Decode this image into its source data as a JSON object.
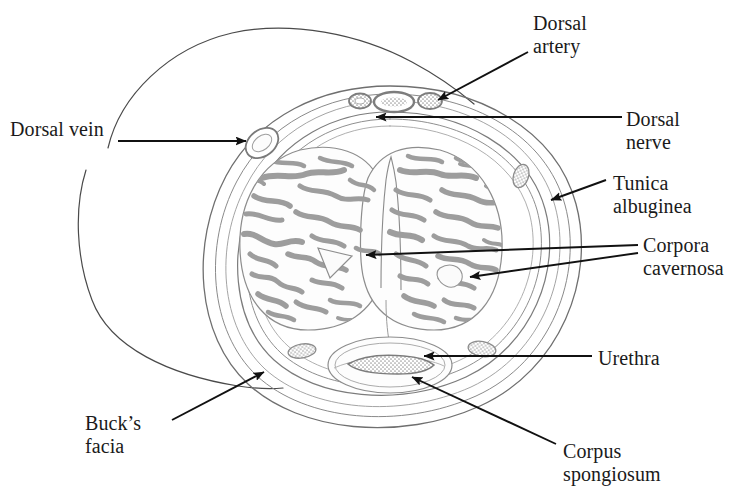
{
  "figure": {
    "background_color": "#ffffff",
    "ink_color": "#1a1a1a",
    "tissue_color": "#9a9a9a"
  },
  "labels": {
    "dorsal_vein": "Dorsal vein",
    "dorsal_artery": "Dorsal\nartery",
    "dorsal_nerve": "Dorsal\nnerve",
    "tunica_albuginea": "Tunica\nalbuginea",
    "corpora_cavernosa": "Corpora\ncavernosa",
    "urethra": "Urethra",
    "corpus_spongiosum": "Corpus\nspongiosum",
    "bucks_facia": "Buck’s\nfacia"
  },
  "structures": [
    {
      "name": "dorsal-vein",
      "label": "Dorsal vein",
      "position": "left-superficial"
    },
    {
      "name": "dorsal-artery",
      "label": "Dorsal artery",
      "position": "dorsal-top-right"
    },
    {
      "name": "dorsal-nerve",
      "label": "Dorsal nerve",
      "position": "dorsal-top-center"
    },
    {
      "name": "tunica-albuginea",
      "label": "Tunica albuginea",
      "position": "right-rim"
    },
    {
      "name": "corpora-cavernosa",
      "label": "Corpora cavernosa",
      "position": "paired-central"
    },
    {
      "name": "urethra",
      "label": "Urethra",
      "position": "ventral-center"
    },
    {
      "name": "corpus-spongiosum",
      "label": "Corpus spongiosum",
      "position": "ventral"
    },
    {
      "name": "bucks-facia",
      "label": "Buck’s facia",
      "position": "outer-envelope"
    }
  ]
}
